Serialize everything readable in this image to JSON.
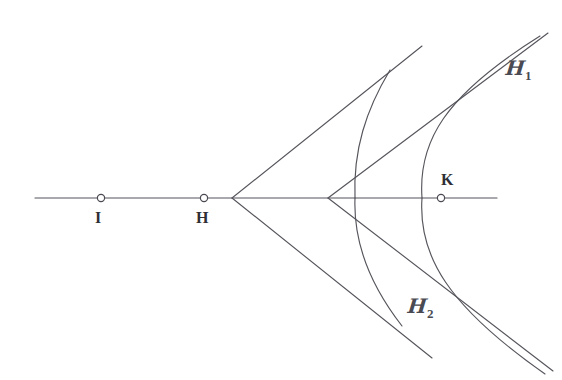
{
  "figure": {
    "kind": "geometric-diagram",
    "background_color": "#ffffff",
    "stroke_color": "#55555c",
    "label_color": "#2e2e34",
    "width": 562,
    "height": 380
  },
  "axis": {
    "name": "horizontal-axis",
    "y": 198,
    "x_start": 35,
    "x_end": 497
  },
  "points": [
    {
      "id": "I",
      "label": "I",
      "x": 101,
      "y": 198,
      "label_x": 95,
      "label_y": 210,
      "radius": 3.6
    },
    {
      "id": "H",
      "label": "H",
      "x": 204,
      "y": 198,
      "label_x": 196,
      "label_y": 210,
      "radius": 3.6
    },
    {
      "id": "K",
      "label": "K",
      "x": 441,
      "y": 198,
      "label_x": 441,
      "label_y": 172,
      "radius": 3.6
    }
  ],
  "vertices": [
    {
      "id": "V1",
      "x": 232,
      "y": 198
    },
    {
      "id": "V2",
      "x": 328,
      "y": 198
    }
  ],
  "asymptotes": [
    {
      "id": "A1-upper",
      "from_vertex": "V1",
      "x1": 232,
      "y1": 198,
      "x2": 422,
      "y2": 46
    },
    {
      "id": "A1-lower",
      "from_vertex": "V1",
      "x1": 232,
      "y1": 198,
      "x2": 432,
      "y2": 358
    },
    {
      "id": "A2-upper",
      "from_vertex": "V2",
      "x1": 328,
      "y1": 198,
      "x2": 548,
      "y2": 33
    },
    {
      "id": "A2-lower",
      "from_vertex": "V2",
      "x1": 328,
      "y1": 198,
      "x2": 553,
      "y2": 371
    }
  ],
  "curves": [
    {
      "id": "H2",
      "label": "H",
      "subscript": "2",
      "label_x": 408,
      "label_y": 296,
      "vertex_x": 355,
      "note": "inner hyperbola branch, vertex on axis, asymptotic to A1 pair"
    },
    {
      "id": "H1",
      "label": "H",
      "subscript": "1",
      "label_x": 506,
      "label_y": 58,
      "vertex_x": 422,
      "note": "outer hyperbola branch, vertex on axis, asymptotic to A2 pair"
    }
  ]
}
